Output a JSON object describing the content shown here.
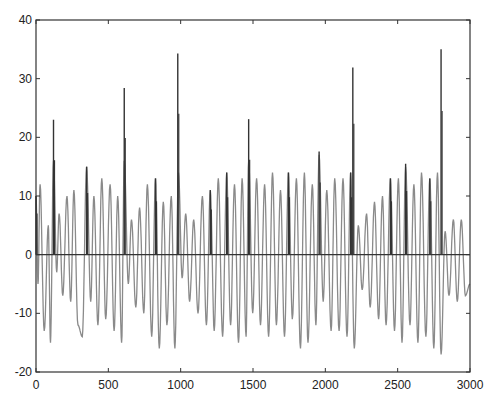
{
  "chart_data": {
    "type": "line",
    "title": "",
    "xlabel": "",
    "ylabel": "",
    "xlim": [
      0,
      3000
    ],
    "ylim": [
      -20,
      40
    ],
    "xticks": [
      0,
      500,
      1000,
      1500,
      2000,
      2500,
      3000
    ],
    "yticks": [
      -20,
      -10,
      0,
      10,
      20,
      30,
      40
    ],
    "grid": false,
    "legend": null,
    "series": [
      {
        "name": "oscillating signal",
        "color": "#8a8a8a",
        "description": "alternating extrema (x, value) of a quasi-periodic oscillation, period ~57 samples",
        "extrema": [
          [
            0,
            10
          ],
          [
            14,
            -5
          ],
          [
            28,
            12
          ],
          [
            57,
            -13
          ],
          [
            85,
            5
          ],
          [
            100,
            -15
          ],
          [
            121,
            16
          ],
          [
            143,
            -3
          ],
          [
            160,
            7
          ],
          [
            185,
            -7
          ],
          [
            214,
            10
          ],
          [
            240,
            -8
          ],
          [
            262,
            11
          ],
          [
            290,
            -12
          ],
          [
            320,
            -14
          ],
          [
            350,
            15
          ],
          [
            378,
            -8
          ],
          [
            400,
            10
          ],
          [
            428,
            -12
          ],
          [
            455,
            13
          ],
          [
            482,
            -11
          ],
          [
            512,
            12
          ],
          [
            540,
            -13
          ],
          [
            565,
            10
          ],
          [
            592,
            -15
          ],
          [
            610,
            16
          ],
          [
            638,
            -5
          ],
          [
            660,
            6
          ],
          [
            690,
            -9
          ],
          [
            716,
            8
          ],
          [
            745,
            -10
          ],
          [
            770,
            12
          ],
          [
            800,
            -14
          ],
          [
            826,
            13
          ],
          [
            852,
            -16
          ],
          [
            880,
            9
          ],
          [
            905,
            -12
          ],
          [
            935,
            10
          ],
          [
            960,
            -16
          ],
          [
            985,
            14
          ],
          [
            1010,
            -4
          ],
          [
            1035,
            7
          ],
          [
            1062,
            -8
          ],
          [
            1090,
            6
          ],
          [
            1120,
            -10
          ],
          [
            1150,
            10
          ],
          [
            1178,
            -12
          ],
          [
            1205,
            11
          ],
          [
            1232,
            -13
          ],
          [
            1260,
            13
          ],
          [
            1290,
            -14
          ],
          [
            1318,
            14
          ],
          [
            1345,
            -12
          ],
          [
            1372,
            12
          ],
          [
            1400,
            -15
          ],
          [
            1425,
            13
          ],
          [
            1452,
            -14
          ],
          [
            1470,
            16
          ],
          [
            1498,
            -10
          ],
          [
            1525,
            13
          ],
          [
            1552,
            -12
          ],
          [
            1580,
            12
          ],
          [
            1608,
            -14
          ],
          [
            1635,
            14
          ],
          [
            1662,
            -12
          ],
          [
            1690,
            11
          ],
          [
            1718,
            -14
          ],
          [
            1745,
            14
          ],
          [
            1772,
            -11
          ],
          [
            1800,
            13
          ],
          [
            1828,
            -16
          ],
          [
            1855,
            14
          ],
          [
            1880,
            -15
          ],
          [
            1910,
            12
          ],
          [
            1935,
            -12
          ],
          [
            1957,
            17
          ],
          [
            1985,
            -8
          ],
          [
            2010,
            11
          ],
          [
            2040,
            -13
          ],
          [
            2065,
            13
          ],
          [
            2095,
            -13
          ],
          [
            2122,
            13
          ],
          [
            2150,
            -14
          ],
          [
            2175,
            14
          ],
          [
            2200,
            -16
          ],
          [
            2228,
            5
          ],
          [
            2255,
            -6
          ],
          [
            2285,
            7
          ],
          [
            2310,
            -9
          ],
          [
            2340,
            9
          ],
          [
            2368,
            -11
          ],
          [
            2395,
            10
          ],
          [
            2420,
            -12
          ],
          [
            2450,
            13
          ],
          [
            2478,
            -13
          ],
          [
            2505,
            13
          ],
          [
            2530,
            -15
          ],
          [
            2555,
            15
          ],
          [
            2585,
            -12
          ],
          [
            2612,
            12
          ],
          [
            2640,
            -15
          ],
          [
            2665,
            14
          ],
          [
            2695,
            -14
          ],
          [
            2722,
            13
          ],
          [
            2750,
            -16
          ],
          [
            2775,
            14
          ],
          [
            2800,
            -17
          ],
          [
            2828,
            4
          ],
          [
            2855,
            -7
          ],
          [
            2885,
            6
          ],
          [
            2912,
            -8
          ],
          [
            2940,
            6
          ],
          [
            2968,
            -7
          ],
          [
            3000,
            -5
          ]
        ]
      },
      {
        "name": "spike signal",
        "color": "#333333",
        "description": "zero baseline with positive spikes (x, peak)",
        "baseline": 0,
        "spikes": [
          [
            0,
            10
          ],
          [
            121,
            23
          ],
          [
            350,
            15
          ],
          [
            610,
            28.4
          ],
          [
            826,
            13
          ],
          [
            980,
            34.3
          ],
          [
            1205,
            11
          ],
          [
            1318,
            14
          ],
          [
            1470,
            23.1
          ],
          [
            1745,
            14
          ],
          [
            1957,
            17.6
          ],
          [
            2175,
            14
          ],
          [
            2190,
            31.9
          ],
          [
            2450,
            13
          ],
          [
            2555,
            15.5
          ],
          [
            2722,
            13
          ],
          [
            2800,
            35
          ]
        ]
      }
    ]
  }
}
